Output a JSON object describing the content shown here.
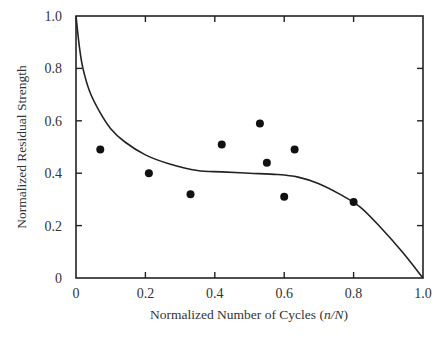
{
  "chart_data": {
    "type": "scatter",
    "title": "",
    "xlabel": "Normalized Number of Cycles (n/N)",
    "xlabel_parts": {
      "prefix": "Normalized Number of Cycles (",
      "italic": "n/N",
      "suffix": ")"
    },
    "ylabel": "Normalized Residual Strength",
    "xlim": [
      0,
      1.0
    ],
    "ylim": [
      0,
      1.0
    ],
    "xticks": [
      "0",
      "0.2",
      "0.4",
      "0.6",
      "0.8",
      "1.0"
    ],
    "yticks": [
      "0",
      "0.2",
      "0.4",
      "0.6",
      "0.8",
      "1.0"
    ],
    "grid": false,
    "legend": null,
    "series": [
      {
        "name": "Experimental data",
        "kind": "scatter",
        "points": [
          {
            "x": 0.07,
            "y": 0.49
          },
          {
            "x": 0.21,
            "y": 0.4
          },
          {
            "x": 0.33,
            "y": 0.32
          },
          {
            "x": 0.42,
            "y": 0.51
          },
          {
            "x": 0.53,
            "y": 0.59
          },
          {
            "x": 0.55,
            "y": 0.44
          },
          {
            "x": 0.6,
            "y": 0.31
          },
          {
            "x": 0.63,
            "y": 0.49
          },
          {
            "x": 0.8,
            "y": 0.29
          }
        ]
      },
      {
        "name": "Model curve",
        "kind": "line",
        "points": [
          {
            "x": 0.0,
            "y": 1.0
          },
          {
            "x": 0.01,
            "y": 0.88
          },
          {
            "x": 0.02,
            "y": 0.8
          },
          {
            "x": 0.04,
            "y": 0.71
          },
          {
            "x": 0.07,
            "y": 0.63
          },
          {
            "x": 0.1,
            "y": 0.57
          },
          {
            "x": 0.14,
            "y": 0.52
          },
          {
            "x": 0.2,
            "y": 0.47
          },
          {
            "x": 0.27,
            "y": 0.435
          },
          {
            "x": 0.35,
            "y": 0.41
          },
          {
            "x": 0.42,
            "y": 0.405
          },
          {
            "x": 0.5,
            "y": 0.4
          },
          {
            "x": 0.58,
            "y": 0.395
          },
          {
            "x": 0.64,
            "y": 0.385
          },
          {
            "x": 0.7,
            "y": 0.36
          },
          {
            "x": 0.76,
            "y": 0.32
          },
          {
            "x": 0.82,
            "y": 0.27
          },
          {
            "x": 0.88,
            "y": 0.19
          },
          {
            "x": 0.94,
            "y": 0.1
          },
          {
            "x": 1.0,
            "y": 0.0
          }
        ]
      }
    ]
  }
}
